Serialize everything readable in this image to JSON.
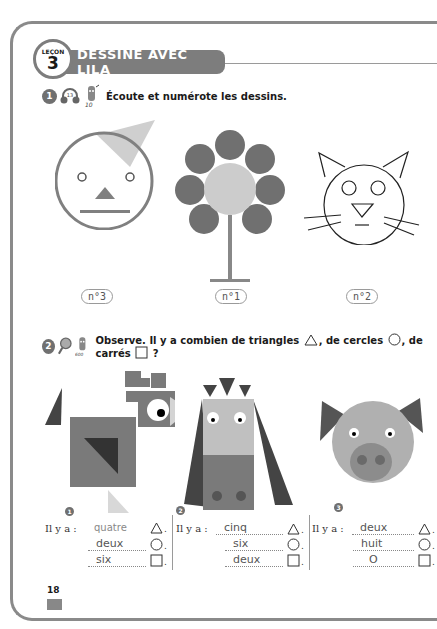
{
  "lesson": {
    "word": "LEÇON",
    "number": "3",
    "title": "DESSINE AVEC LILA"
  },
  "exercise1": {
    "number": "1",
    "icons": [
      "headphones-track-13-icon",
      "pencil-10-icon"
    ],
    "track": "13",
    "instruction": "Écoute et numérote les dessins.",
    "drawings": [
      {
        "name": "face",
        "label": "n°3"
      },
      {
        "name": "flower",
        "label": "n°1"
      },
      {
        "name": "cat",
        "label": "n°2"
      }
    ]
  },
  "exercise2": {
    "number": "2",
    "icons": [
      "magnifier-icon",
      "pencil-600-icon"
    ],
    "instruction_parts": [
      "Observe. Il y a combien de triangles",
      ", de cercles",
      ", de carrés",
      " ?"
    ],
    "figures": [
      {
        "index": "1",
        "name": "bird",
        "prefix": "Il y a :",
        "answers": {
          "triangles": "quatre",
          "circles": "deux",
          "squares": "six"
        },
        "triangles_printed": true
      },
      {
        "index": "2",
        "name": "cow",
        "prefix": "Il y a :",
        "answers": {
          "triangles": "cinq",
          "circles": "six",
          "squares": "deux"
        },
        "triangles_printed": false
      },
      {
        "index": "3",
        "name": "pig",
        "prefix": "Il y a :",
        "answers": {
          "triangles": "deux",
          "circles": "huit",
          "squares": "O"
        },
        "triangles_printed": false
      }
    ],
    "row_end": "."
  },
  "footer": {
    "page_number": "18"
  },
  "colors": {
    "dark_gray": "#4a4a4a",
    "mid_gray": "#7d7d7d",
    "light_gray": "#c8c8c8",
    "frame": "#8a8a8a"
  }
}
